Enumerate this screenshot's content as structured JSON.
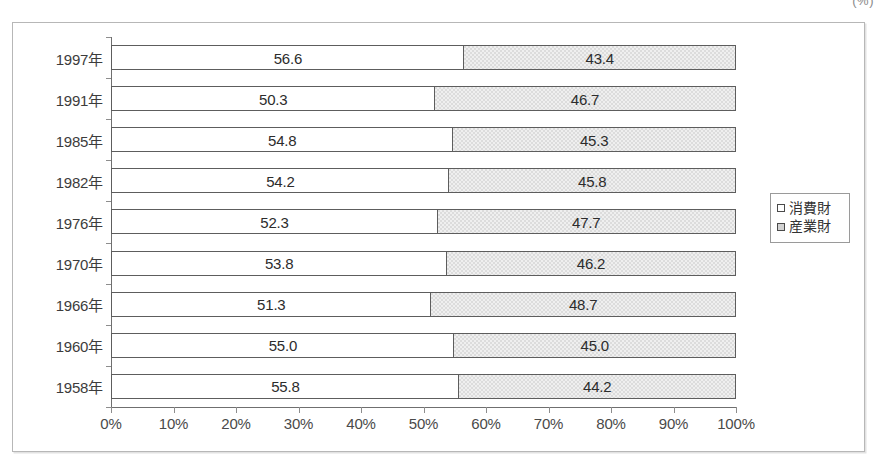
{
  "unit_note": "(%)",
  "legend": {
    "items": [
      {
        "label": "消費財",
        "swatch": "white-square-icon",
        "color": "#ffffff"
      },
      {
        "label": "産業財",
        "swatch": "gray-square-icon",
        "color": "#d2d2d2"
      }
    ]
  },
  "axis": {
    "x_ticks": [
      "0%",
      "10%",
      "20%",
      "30%",
      "40%",
      "50%",
      "60%",
      "70%",
      "80%",
      "90%",
      "100%"
    ]
  },
  "chart_data": {
    "type": "bar",
    "title": "",
    "subtitle": "",
    "xlabel": "",
    "ylabel": "",
    "unit": "(%)",
    "orientation": "horizontal",
    "stacked": "100%",
    "grid": false,
    "legend_position": "right",
    "xlim": [
      0,
      100
    ],
    "xticks": [
      0,
      10,
      20,
      30,
      40,
      50,
      60,
      70,
      80,
      90,
      100
    ],
    "xtick_labels": [
      "0%",
      "10%",
      "20%",
      "30%",
      "40%",
      "50%",
      "60%",
      "70%",
      "80%",
      "90%",
      "100%"
    ],
    "categories": [
      "1997年",
      "1991年",
      "1985年",
      "1982年",
      "1976年",
      "1970年",
      "1966年",
      "1960年",
      "1958年"
    ],
    "series": [
      {
        "name": "消費財",
        "color": "#ffffff",
        "values": [
          56.6,
          50.3,
          54.8,
          54.2,
          52.3,
          53.8,
          51.3,
          55.0,
          55.8
        ],
        "labels": [
          "56.6",
          "50.3",
          "54.8",
          "54.2",
          "52.3",
          "53.8",
          "51.3",
          "55.0",
          "55.8"
        ]
      },
      {
        "name": "産業財",
        "color": "#d2d2d2",
        "values": [
          43.4,
          46.7,
          45.3,
          45.8,
          47.7,
          46.2,
          48.7,
          45.0,
          44.2
        ],
        "labels": [
          "43.4",
          "46.7",
          "45.3",
          "45.8",
          "47.7",
          "46.2",
          "48.7",
          "45.0",
          "44.2"
        ]
      }
    ],
    "rows": [
      {
        "category": "1997年",
        "consumer": 56.6,
        "industrial": 43.4,
        "split_pct": 56.6
      },
      {
        "category": "1991年",
        "consumer": 50.3,
        "industrial": 46.7,
        "split_pct": 51.9
      },
      {
        "category": "1985年",
        "consumer": 54.8,
        "industrial": 45.3,
        "split_pct": 54.8
      },
      {
        "category": "1982年",
        "consumer": 54.2,
        "industrial": 45.8,
        "split_pct": 54.2
      },
      {
        "category": "1976年",
        "consumer": 52.3,
        "industrial": 47.7,
        "split_pct": 52.3
      },
      {
        "category": "1970年",
        "consumer": 53.8,
        "industrial": 46.2,
        "split_pct": 53.8
      },
      {
        "category": "1966年",
        "consumer": 51.3,
        "industrial": 48.7,
        "split_pct": 51.3
      },
      {
        "category": "1960年",
        "consumer": 55.0,
        "industrial": 45.0,
        "split_pct": 55.0
      },
      {
        "category": "1958年",
        "consumer": 55.8,
        "industrial": 44.2,
        "split_pct": 55.8
      }
    ]
  }
}
